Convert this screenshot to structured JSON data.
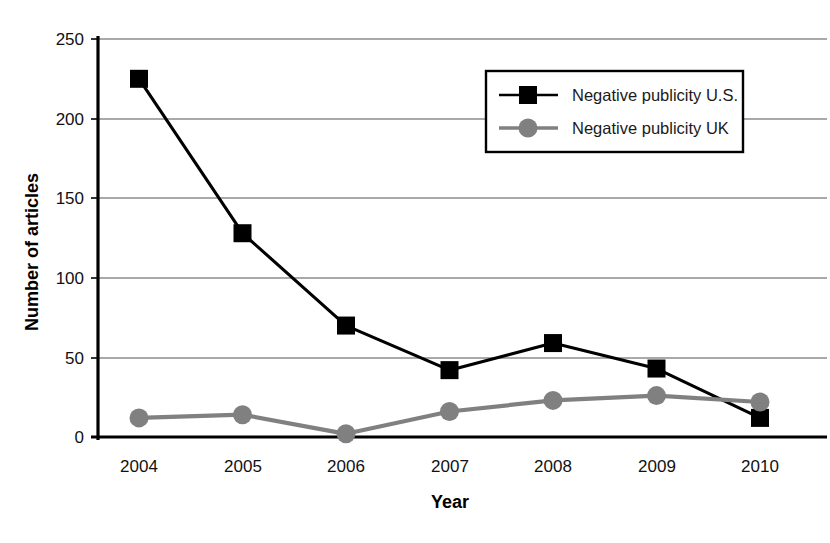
{
  "chart_data": {
    "type": "line",
    "title": "",
    "xlabel": "Year",
    "ylabel": "Number of articles",
    "categories": [
      "2004",
      "2005",
      "2006",
      "2007",
      "2008",
      "2009",
      "2010"
    ],
    "x": [
      2004,
      2005,
      2006,
      2007,
      2008,
      2009,
      2010
    ],
    "series": [
      {
        "name": "Negative publicity U.S.",
        "values": [
          225,
          128,
          70,
          42,
          59,
          43,
          12
        ],
        "color": "#000000",
        "marker": "square"
      },
      {
        "name": "Negative publicity UK",
        "values": [
          12,
          14,
          2,
          16,
          23,
          26,
          22
        ],
        "color": "#808080",
        "marker": "circle"
      }
    ],
    "ylim": [
      0,
      250
    ],
    "yticks": [
      0,
      50,
      100,
      150,
      200,
      250
    ],
    "ytick_labels": [
      "0",
      "50",
      "100",
      "150",
      "200",
      "250"
    ],
    "grid": true,
    "grid_axis": "y",
    "legend_position": "upper-right-inside"
  },
  "axes": {
    "y_title": "Number of articles",
    "x_title": "Year",
    "y_ticks": [
      "0",
      "50",
      "100",
      "150",
      "200",
      "250"
    ],
    "x_ticks": [
      "2004",
      "2005",
      "2006",
      "2007",
      "2008",
      "2009",
      "2010"
    ]
  },
  "legend": {
    "entries": [
      {
        "label": "Negative publicity U.S.",
        "color": "#000000",
        "marker": "square-marker"
      },
      {
        "label": "Negative publicity UK",
        "color": "#808080",
        "marker": "circle-marker"
      }
    ]
  },
  "colors": {
    "series_us": "#000000",
    "series_uk": "#808080",
    "grid": "#999999",
    "axis": "#000000",
    "background": "#ffffff"
  }
}
